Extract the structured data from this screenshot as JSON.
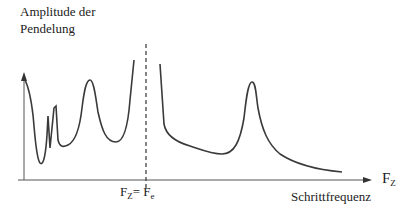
{
  "diagram": {
    "type": "resonance-curve",
    "y_axis_label_line1": "Amplitude der",
    "y_axis_label_line2": "Pendelung",
    "x_axis_label": "Schrittfrequenz",
    "x_axis_symbol_main": "F",
    "x_axis_symbol_sub": "Z",
    "marker_left_main": "F",
    "marker_left_sub": "Z",
    "marker_eq": "=",
    "marker_right_main": "F",
    "marker_right_sub": "e",
    "colors": {
      "curve": "#3a3a3a",
      "axis": "#555555",
      "dashed": "#444444"
    }
  }
}
